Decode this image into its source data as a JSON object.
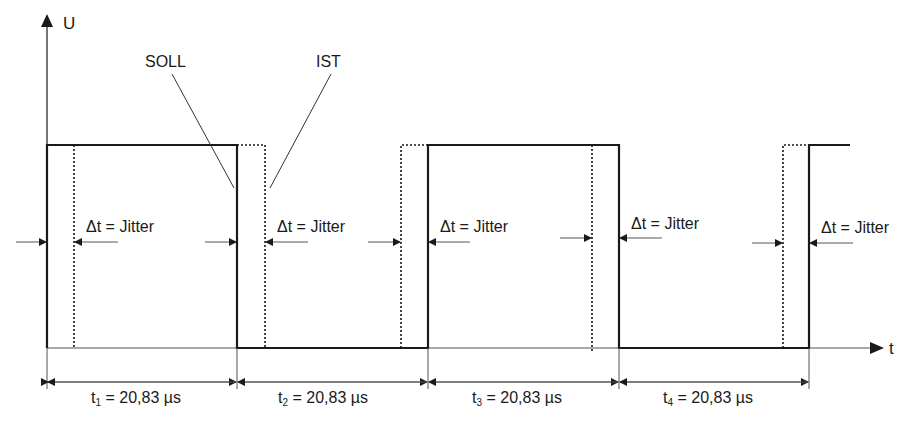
{
  "axes": {
    "y_label": "U",
    "x_label": "t"
  },
  "callouts": {
    "soll": "SOLL",
    "ist": "IST"
  },
  "jitter": [
    {
      "delta": "Δt",
      "text": " = Jitter"
    },
    {
      "delta": "Δt",
      "text": " = Jitter"
    },
    {
      "delta": "Δt",
      "text": " = Jitter"
    },
    {
      "delta": "Δt",
      "text": " = Jitter"
    },
    {
      "delta": "Δt",
      "text": " = Jitter"
    }
  ],
  "periods": [
    {
      "symbol": "t",
      "index": "1",
      "value": " = 20,83 µs"
    },
    {
      "symbol": "t",
      "index": "2",
      "value": " = 20,83 µs"
    },
    {
      "symbol": "t",
      "index": "3",
      "value": " = 20,83 µs"
    },
    {
      "symbol": "t",
      "index": "4",
      "value": " = 20,83 µs"
    }
  ],
  "colors": {
    "line": "#1a1a1a",
    "thin": "#555555"
  }
}
